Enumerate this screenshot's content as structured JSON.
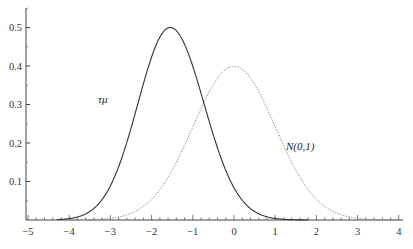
{
  "chart_data": {
    "type": "line",
    "title": "",
    "xlabel": "",
    "ylabel": "",
    "xlim": [
      -5,
      4
    ],
    "ylim": [
      0,
      0.55
    ],
    "grid": false,
    "x_ticks": [
      "-5",
      "-4",
      "-3",
      "-2",
      "-1",
      "0",
      "1",
      "2",
      "3",
      "4"
    ],
    "y_ticks": [
      "0.1",
      "0.2",
      "0.3",
      "0.4",
      "0.5"
    ],
    "series": [
      {
        "name": "τμ",
        "style": "solid",
        "description": "Dickey-Fuller tau_mu density, peak ~0.5 at x ~ -1.5",
        "x": [
          -4.5,
          -4.0,
          -3.5,
          -3.0,
          -2.5,
          -2.0,
          -1.5,
          -1.0,
          -0.5,
          0.0,
          0.5,
          1.0,
          1.5,
          2.0
        ],
        "y": [
          0.0,
          0.005,
          0.03,
          0.12,
          0.29,
          0.45,
          0.5,
          0.4,
          0.23,
          0.1,
          0.035,
          0.01,
          0.002,
          0.0
        ]
      },
      {
        "name": "N(0,1)",
        "style": "dotted",
        "description": "Standard normal density",
        "x": [
          -4.0,
          -3.5,
          -3.0,
          -2.5,
          -2.0,
          -1.5,
          -1.0,
          -0.5,
          0.0,
          0.5,
          1.0,
          1.5,
          2.0,
          2.5,
          3.0,
          3.5,
          4.0
        ],
        "y": [
          0.0001,
          0.0009,
          0.0044,
          0.0175,
          0.054,
          0.1295,
          0.242,
          0.352,
          0.399,
          0.352,
          0.242,
          0.1295,
          0.054,
          0.0175,
          0.0044,
          0.0009,
          0.0001
        ]
      }
    ],
    "annotations": [
      {
        "text": "τμ",
        "x": -2.9,
        "y": 0.31
      },
      {
        "text": "N(0,1)",
        "x": 1.4,
        "y": 0.19
      }
    ]
  },
  "labels": {
    "tau": "τμ",
    "normal": "N(0,1)"
  }
}
